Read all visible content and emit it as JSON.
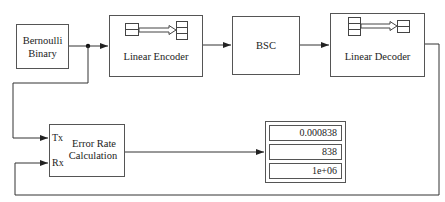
{
  "diagram": {
    "blocks": {
      "source": {
        "label_line1": "Bernoulli",
        "label_line2": "Binary"
      },
      "encoder": {
        "label": "Linear Encoder",
        "icon": "encoder-shift-icon"
      },
      "channel": {
        "label": "BSC"
      },
      "decoder": {
        "label": "Linear Decoder",
        "icon": "decoder-shift-icon"
      },
      "error_rate": {
        "label_line1": "Error Rate",
        "label_line2": "Calculation",
        "port_tx": "Tx",
        "port_rx": "Rx"
      },
      "display": {
        "values": [
          "0.000838",
          "838",
          "1e+06"
        ]
      }
    },
    "connections": [
      "Bernoulli Binary -> Linear Encoder",
      "Bernoulli Binary -> Error Rate Calculation.Tx",
      "Linear Encoder -> BSC",
      "BSC -> Linear Decoder",
      "Linear Decoder -> Error Rate Calculation.Rx",
      "Error Rate Calculation -> Display"
    ],
    "colors": {
      "line": "#333333",
      "border": "#555555",
      "background": "#ffffff"
    }
  }
}
